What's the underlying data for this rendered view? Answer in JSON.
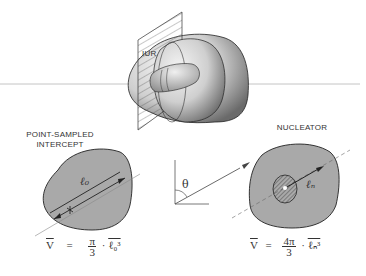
{
  "labels": {
    "iur": "IUR",
    "left_title_line1": "POINT-SAMPLED",
    "left_title_line2": "INTERCEPT",
    "right_title": "NUCLEATOR",
    "theta": "θ",
    "l0": "ℓ₀",
    "ln": "ℓₙ"
  },
  "formulas": {
    "left": {
      "lhs": "V",
      "eq": "=",
      "num": "π",
      "den": "3",
      "dot": "·",
      "term": "ℓ₀³"
    },
    "right": {
      "lhs": "V",
      "eq": "=",
      "num": "4π",
      "den": "3",
      "dot": "·",
      "term": "ℓₙ³"
    }
  },
  "colors": {
    "profile_fill": "#a9a9a9",
    "nucleus_fill": "#6e6e6e",
    "line": "#333333",
    "axis_line": "#b5b5b5"
  }
}
